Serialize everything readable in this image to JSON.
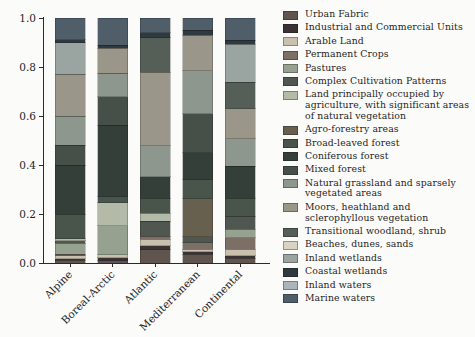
{
  "figure": {
    "background": "#fbfbf9",
    "axis_color": "#2a2a2a"
  },
  "chart_data": {
    "type": "bar",
    "stacked": true,
    "normalized": true,
    "title": "",
    "xlabel": "",
    "ylabel": "",
    "ylim": [
      0,
      1.0
    ],
    "grid": false,
    "legend_position": "right",
    "categories": [
      "Alpine",
      "Boreal-Arctic",
      "Atlantic",
      "Mediterranean",
      "Continental"
    ],
    "ytick_labels": [
      "0.0",
      "0.2",
      "0.4",
      "0.6",
      "0.8",
      "1.0"
    ],
    "yticks": [
      0,
      0.2,
      0.4,
      0.6,
      0.8,
      1.0
    ],
    "series": [
      {
        "name": "Urban Fabric",
        "color": "#5f554e",
        "values": [
          0.012,
          0.01,
          0.055,
          0.035,
          0.02
        ]
      },
      {
        "name": "Industrial and Commercial Units",
        "color": "#3a3234",
        "values": [
          0.005,
          0.012,
          0.015,
          0.01,
          0.01
        ]
      },
      {
        "name": "Arable Land",
        "color": "#c9c0ae",
        "values": [
          0.013,
          0.012,
          0.026,
          0.011,
          0.026
        ]
      },
      {
        "name": "Permanent Crops",
        "color": "#7b6f66",
        "values": [
          0.005,
          0.0,
          0.014,
          0.027,
          0.047
        ]
      },
      {
        "name": "Pastures",
        "color": "#97a18f",
        "values": [
          0.045,
          0.118,
          0.0,
          0.0,
          0.034
        ]
      },
      {
        "name": "Complex Cultivation Patterns",
        "color": "#4f5750",
        "values": [
          0.01,
          0.0,
          0.06,
          0.024,
          0.053
        ]
      },
      {
        "name": "Land principally occupied by agriculture, with significant areas of natural vegetation",
        "color": "#b4baa8",
        "values": [
          0.01,
          0.093,
          0.034,
          0.0,
          0.0
        ]
      },
      {
        "name": "Agro-forestry areas",
        "color": "#68604f",
        "values": [
          0.0,
          0.0,
          0.0,
          0.155,
          0.0
        ]
      },
      {
        "name": "Broad-leaved forest",
        "color": "#49544a",
        "values": [
          0.1,
          0.025,
          0.06,
          0.078,
          0.075
        ]
      },
      {
        "name": "Coniferous forest",
        "color": "#343f39",
        "values": [
          0.2,
          0.293,
          0.088,
          0.11,
          0.129
        ]
      },
      {
        "name": "Mixed forest",
        "color": "#465049",
        "values": [
          0.08,
          0.115,
          0.0,
          0.16,
          0.0
        ]
      },
      {
        "name": "Natural grassland and sparsely vegetated areas",
        "color": "#8d978e",
        "values": [
          0.12,
          0.097,
          0.127,
          0.175,
          0.114
        ]
      },
      {
        "name": "Moors, heathland and sclerophyllous vegetation",
        "color": "#9a968a",
        "values": [
          0.17,
          0.102,
          0.299,
          0.145,
          0.122
        ]
      },
      {
        "name": "Transitional woodland, shrub",
        "color": "#555f57",
        "values": [
          0.0,
          0.0,
          0.142,
          0.0,
          0.108
        ]
      },
      {
        "name": "Beaches, dunes, sands",
        "color": "#d8d3c2",
        "values": [
          0.0,
          0.0,
          0.0,
          0.0,
          0.0
        ]
      },
      {
        "name": "Inland wetlands",
        "color": "#9aa4a0",
        "values": [
          0.13,
          0.0,
          0.0,
          0.0,
          0.155
        ]
      },
      {
        "name": "Coastal wetlands",
        "color": "#2e3a40",
        "values": [
          0.012,
          0.012,
          0.02,
          0.02,
          0.017
        ]
      },
      {
        "name": "Inland waters",
        "color": "#aab4ba",
        "values": [
          0.0,
          0.0,
          0.0,
          0.0,
          0.0
        ]
      },
      {
        "name": "Marine waters",
        "color": "#505e6a",
        "values": [
          0.088,
          0.111,
          0.06,
          0.05,
          0.09
        ]
      }
    ]
  }
}
